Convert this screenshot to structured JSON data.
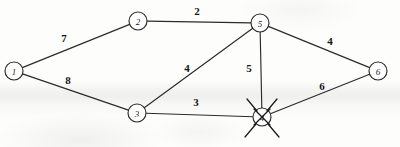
{
  "diagram": {
    "type": "graph",
    "width": 400,
    "height": 147,
    "stroke_color": "#2b2b2b",
    "label_color": "#151515",
    "node_fill": "#ffffff",
    "background": "#fdfdfc"
  },
  "nodes": [
    {
      "id": "1",
      "label": "1",
      "x": 14,
      "y": 71,
      "r": 9,
      "crossed_out": false
    },
    {
      "id": "2",
      "label": "2",
      "x": 138,
      "y": 21,
      "r": 9,
      "crossed_out": false
    },
    {
      "id": "3",
      "label": "3",
      "x": 137,
      "y": 113,
      "r": 9,
      "crossed_out": false
    },
    {
      "id": "4",
      "label": "4",
      "x": 262,
      "y": 117,
      "r": 9,
      "crossed_out": true
    },
    {
      "id": "5",
      "label": "5",
      "x": 260,
      "y": 23,
      "r": 9,
      "crossed_out": false
    },
    {
      "id": "6",
      "label": "6",
      "x": 378,
      "y": 71,
      "r": 9,
      "crossed_out": false
    }
  ],
  "edges": [
    {
      "from": "1",
      "to": "2",
      "weight": "7",
      "label_x": 64,
      "label_y": 38
    },
    {
      "from": "1",
      "to": "3",
      "weight": "8",
      "label_x": 68,
      "label_y": 80
    },
    {
      "from": "2",
      "to": "5",
      "weight": "2",
      "label_x": 197,
      "label_y": 11
    },
    {
      "from": "3",
      "to": "5",
      "weight": "4",
      "label_x": 187,
      "label_y": 68
    },
    {
      "from": "3",
      "to": "4",
      "weight": "3",
      "label_x": 196,
      "label_y": 102
    },
    {
      "from": "5",
      "to": "4",
      "weight": "5",
      "label_x": 249,
      "label_y": 68
    },
    {
      "from": "5",
      "to": "6",
      "weight": "4",
      "label_x": 330,
      "label_y": 41
    },
    {
      "from": "4",
      "to": "6",
      "weight": "6",
      "label_x": 322,
      "label_y": 86
    }
  ],
  "cross_out_marks": {
    "node_id": "4",
    "description": "X mark through node with radiating strike strokes",
    "strokes": [
      {
        "x1": 254,
        "y1": 109,
        "x2": 270,
        "y2": 125
      },
      {
        "x1": 270,
        "y1": 109,
        "x2": 254,
        "y2": 125
      },
      {
        "x1": 247,
        "y1": 99,
        "x2": 257,
        "y2": 111
      },
      {
        "x1": 277,
        "y1": 99,
        "x2": 267,
        "y2": 111
      },
      {
        "x1": 245,
        "y1": 137,
        "x2": 256,
        "y2": 124
      },
      {
        "x1": 279,
        "y1": 137,
        "x2": 268,
        "y2": 124
      }
    ]
  }
}
